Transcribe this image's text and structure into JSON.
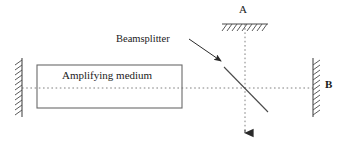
{
  "figure": {
    "background_color": "#ffffff",
    "line_color": "#555555",
    "dotted_color": "#777777",
    "text_color": "#1a1a1a"
  },
  "labels": {
    "amplifying_medium": "Amplifying medium",
    "beamsplitter": "Beamsplitter",
    "mirror_a": "A",
    "mirror_b": "B"
  },
  "components": {
    "amplifying_medium_box": {
      "name": "Amplifying medium",
      "x": 37,
      "y": 65,
      "width": 145,
      "height": 43
    },
    "left_mirror": {
      "name": "left mirror",
      "x": 22,
      "y_top": 58,
      "y_bottom": 117,
      "hatch_side": "left",
      "hatch_count": 11
    },
    "right_mirror": {
      "name": "mirror B",
      "x": 313,
      "y_top": 58,
      "y_bottom": 117,
      "hatch_side": "right",
      "hatch_count": 11
    },
    "top_mirror": {
      "name": "mirror A",
      "y": 24,
      "x_left": 222,
      "x_right": 268,
      "hatch_side": "below",
      "hatch_count": 9
    },
    "beamsplitter_line": {
      "name": "beamsplitter",
      "x1": 224,
      "y1": 67,
      "x2": 268,
      "y2": 112
    },
    "horizontal_beam": {
      "name": "horizontal optical axis",
      "x1": 22,
      "x2": 313,
      "y": 88,
      "style": "dotted"
    },
    "vertical_beam": {
      "name": "vertical output beam",
      "x": 245,
      "y1": 24,
      "y2": 141,
      "style": "dotted",
      "arrowhead": "down"
    },
    "callout_arrow": {
      "name": "beamsplitter callout arrow",
      "x1": 190,
      "y1": 40,
      "x2": 222,
      "y2": 62,
      "arrowhead": "end"
    }
  }
}
